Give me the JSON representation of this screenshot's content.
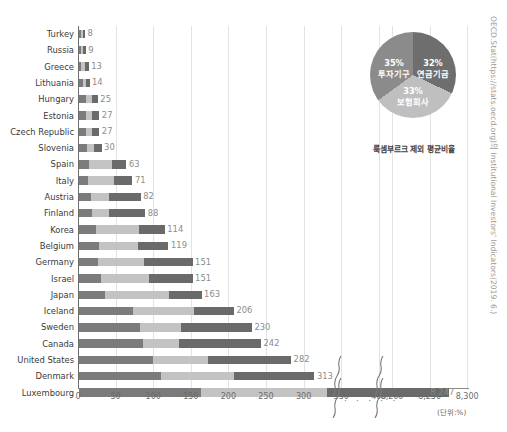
{
  "chart_data": {
    "type": "bar",
    "orientation": "horizontal",
    "stacked": true,
    "title": "",
    "xlabel": "",
    "ylabel": "",
    "unit_label": "(단위:%)",
    "xlim": [
      0,
      430
    ],
    "xticks": [
      "0",
      "50",
      "100",
      "150",
      "200",
      "250",
      "300",
      "350",
      "400"
    ],
    "xtick_values": [
      0,
      50,
      100,
      150,
      200,
      250,
      300,
      350,
      400
    ],
    "break_xticks": [
      "8,200",
      "8,250",
      "8,300"
    ],
    "break_xtick_values": [
      8200,
      8250,
      8300
    ],
    "axis_break": true,
    "break_dots": "· · · · ·",
    "grid": true,
    "legend_position": "none",
    "categories": [
      "Turkey",
      "Russia",
      "Greece",
      "Lithuania",
      "Hungary",
      "Estonia",
      "Czech Republic",
      "Slovenia",
      "Spain",
      "Italy",
      "Austria",
      "Finland",
      "Korea",
      "Belgium",
      "Germany",
      "Israel",
      "Japan",
      "Iceland",
      "Sweden",
      "Canada",
      "United States",
      "Denmark",
      "Luxembourg"
    ],
    "values": [
      8,
      9,
      13,
      14,
      25,
      27,
      27,
      30,
      63,
      71,
      82,
      88,
      114,
      119,
      151,
      151,
      163,
      206,
      230,
      242,
      282,
      313,
      8247
    ],
    "value_labels": [
      "8",
      "9",
      "13",
      "14",
      "25",
      "27",
      "27",
      "30",
      "63",
      "71",
      "82",
      "88",
      "114",
      "119",
      "151",
      "151",
      "163",
      "206",
      "230",
      "242",
      "282",
      "313",
      "8,247"
    ],
    "series": [
      {
        "name": "투자기구",
        "color": "#7b7b7b",
        "values": [
          2.8,
          3.2,
          2.6,
          4.9,
          8.8,
          9.5,
          9.5,
          10.5,
          13.9,
          12.4,
          15.6,
          16.8,
          22.8,
          26.2,
          25.7,
          28.7,
          34.2,
          72.1,
          80.5,
          84.7,
          98.7,
          109.6,
          2886
        ]
      },
      {
        "name": "보험회사",
        "color": "#c3c3c3",
        "values": [
          2.4,
          2.6,
          5.1,
          4.1,
          8.2,
          8.1,
          8.1,
          9.0,
          30.2,
          34.1,
          23.8,
          23.2,
          56.6,
          52.4,
          60.4,
          64.9,
          85.6,
          81.4,
          55.2,
          48.4,
          73.3,
          95.9,
          2700
        ]
      },
      {
        "name": "연금기금",
        "color": "#6a6a6a",
        "values": [
          2.8,
          3.2,
          5.3,
          5.0,
          8.0,
          9.4,
          9.4,
          10.5,
          18.9,
          24.5,
          42.6,
          48.0,
          34.6,
          40.4,
          64.9,
          57.4,
          43.2,
          52.5,
          94.3,
          108.9,
          110.0,
          107.5,
          2661
        ]
      }
    ]
  },
  "pie_chart": {
    "type": "pie",
    "caption": "룩셈부르크 제외 평균비율",
    "slices": [
      {
        "label": "투자기구",
        "pct_label": "35%",
        "value": 35,
        "color": "#6e6e6e"
      },
      {
        "label": "보험회사",
        "pct_label": "33%",
        "value": 33,
        "color": "#bfbfbf"
      },
      {
        "label": "연금기금",
        "pct_label": "32%",
        "value": 32,
        "color": "#8b8b8b"
      }
    ]
  },
  "source_note": "OECD.Stat(https://stats.oecd.org)의 Institutional Investors' Indicators(2019. 6.)"
}
